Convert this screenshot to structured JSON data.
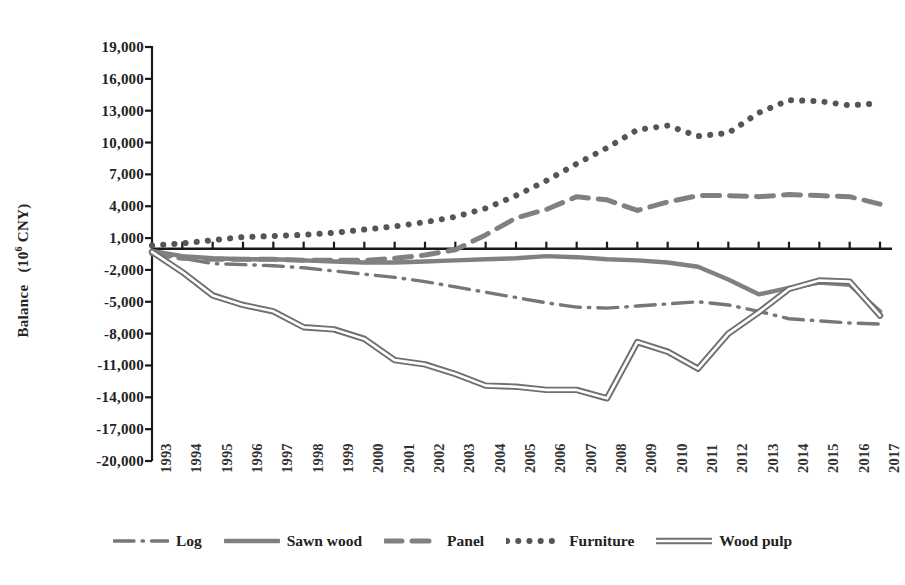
{
  "chart_data": {
    "type": "line",
    "title": "",
    "xlabel": "",
    "ylabel": "Balance （10⁶ CNY）",
    "ylabel_text": "Balance",
    "ylabel_unit": "(10",
    "ylabel_exp": "6",
    "ylabel_unit_end": " CNY)",
    "ylim": [
      -20000,
      19000
    ],
    "ytick_step": 3000,
    "grid": false,
    "legend_position": "bottom",
    "x": [
      1993,
      1994,
      1995,
      1996,
      1997,
      1998,
      1999,
      2000,
      2001,
      2002,
      2003,
      2004,
      2005,
      2006,
      2007,
      2008,
      2009,
      2010,
      2011,
      2012,
      2013,
      2014,
      2015,
      2016,
      2017
    ],
    "categories": [
      "1993",
      "1994",
      "1995",
      "1996",
      "1997",
      "1998",
      "1999",
      "2000",
      "2001",
      "2002",
      "2003",
      "2004",
      "2005",
      "2006",
      "2007",
      "2008",
      "2009",
      "2010",
      "2011",
      "2012",
      "2013",
      "2014",
      "2015",
      "2016",
      "2017"
    ],
    "yticks": [
      19000,
      16000,
      13000,
      10000,
      7000,
      4000,
      1000,
      -2000,
      -5000,
      -8000,
      -11000,
      -14000,
      -17000,
      -20000
    ],
    "ytick_labels": [
      "19,000",
      "16,000",
      "13,000",
      "10,000",
      "7,000",
      "4,000",
      "1,000",
      "-2,000",
      "-5,000",
      "-8,000",
      "-11,000",
      "-14,000",
      "-17,000",
      "-20,000"
    ],
    "series": [
      {
        "name": "Log",
        "style": "dash-dot",
        "color": "#777777",
        "width": 3.4,
        "values": [
          -300,
          -900,
          -1400,
          -1500,
          -1600,
          -1800,
          -2100,
          -2400,
          -2700,
          -3100,
          -3600,
          -4100,
          -4600,
          -5100,
          -5500,
          -5600,
          -5400,
          -5200,
          -5000,
          -5300,
          -5900,
          -6600,
          -6800,
          -7000,
          -7100
        ]
      },
      {
        "name": "Sawn wood",
        "style": "solid",
        "color": "#808080",
        "width": 4.4,
        "values": [
          -200,
          -700,
          -900,
          -1000,
          -1000,
          -1100,
          -1200,
          -1300,
          -1300,
          -1200,
          -1100,
          -1000,
          -900,
          -700,
          -800,
          -1000,
          -1100,
          -1300,
          -1700,
          -2900,
          -4300,
          -3700,
          -3200,
          -3400,
          -5900
        ]
      },
      {
        "name": "Panel",
        "style": "dashed",
        "color": "#808080",
        "width": 5.0,
        "values": [
          -500,
          -900,
          -1000,
          -1000,
          -1000,
          -1100,
          -1100,
          -1100,
          -900,
          -600,
          -100,
          1300,
          2900,
          3700,
          4900,
          4600,
          3600,
          4400,
          5000,
          5000,
          4900,
          5100,
          5000,
          4900,
          4200
        ]
      },
      {
        "name": "Furniture",
        "style": "dotted",
        "color": "#555555",
        "width": 6.0,
        "values": [
          300,
          500,
          800,
          1100,
          1200,
          1300,
          1500,
          1800,
          2100,
          2500,
          3000,
          3800,
          5000,
          6400,
          8000,
          9500,
          11200,
          11600,
          10600,
          10900,
          12800,
          14000,
          13900,
          13500,
          13700
        ]
      },
      {
        "name": "Wood pulp",
        "style": "double",
        "color": "#8a8a8a",
        "width": 3.0,
        "values": [
          -300,
          -2200,
          -4400,
          -5300,
          -5900,
          -7400,
          -7600,
          -8500,
          -10500,
          -10900,
          -11800,
          -12900,
          -13000,
          -13300,
          -13300,
          -14100,
          -8800,
          -9700,
          -11300,
          -8000,
          -6000,
          -3800,
          -3000,
          -3100,
          -6300
        ]
      }
    ]
  },
  "legend": {
    "items": [
      {
        "label": "Log",
        "style": "dash-dot"
      },
      {
        "label": "Sawn wood",
        "style": "solid"
      },
      {
        "label": "Panel",
        "style": "dashed"
      },
      {
        "label": "Furniture",
        "style": "dotted"
      },
      {
        "label": "Wood pulp",
        "style": "double"
      }
    ]
  },
  "colors": {
    "axis": "#1a1a1a",
    "text": "#232323",
    "background": "#ffffff"
  }
}
